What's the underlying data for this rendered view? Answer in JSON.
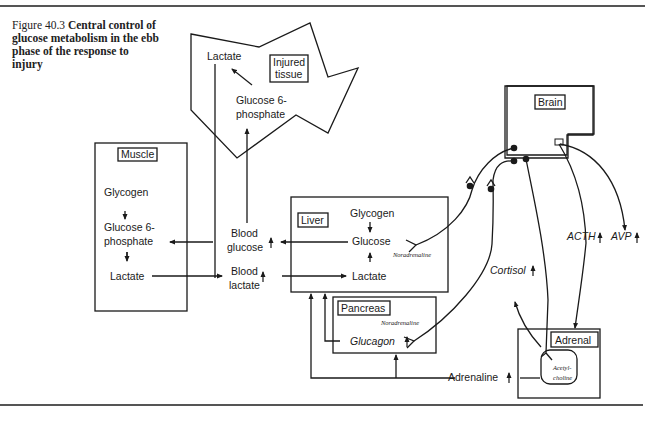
{
  "figure": {
    "number": "Figure 40.3",
    "title": "Central control of glucose metabolism in the ebb phase of the response to injury"
  },
  "nodes": {
    "injured_tissue": {
      "label_line1": "Injured",
      "label_line2": "tissue",
      "lactate": "Lactate",
      "g6p_line1": "Glucose 6-",
      "g6p_line2": "phosphate"
    },
    "muscle": {
      "label": "Muscle",
      "glycogen": "Glycogen",
      "g6p_line1": "Glucose 6-",
      "g6p_line2": "phosphate",
      "lactate": "Lactate"
    },
    "blood": {
      "glucose_line1": "Blood",
      "glucose_line2": "glucose",
      "lactate_line1": "Blood",
      "lactate_line2": "lactate"
    },
    "liver": {
      "label": "Liver",
      "glycogen": "Glycogen",
      "glucose": "Glucose",
      "lactate": "Lactate",
      "nerve": "Noradrenaline"
    },
    "pancreas": {
      "label": "Pancreas",
      "glucagon": "Glucagon",
      "nerve": "Noradrenaline"
    },
    "brain": {
      "label": "Brain"
    },
    "adrenal": {
      "label": "Adrenal",
      "ach_line1": "Acetyl-",
      "ach_line2": "choline"
    },
    "hormones": {
      "adrenaline": "Adrenaline",
      "cortisol": "Cortisol",
      "acth": "ACTH",
      "avp": "AVP"
    }
  },
  "colors": {
    "line": "#1a1a1a",
    "rule": "#555555",
    "background": "#ffffff"
  }
}
